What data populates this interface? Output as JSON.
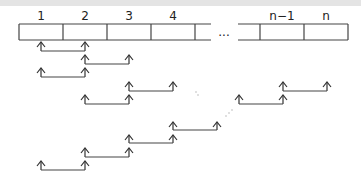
{
  "diagram": {
    "type": "array-pairwise-comparison",
    "cells": [
      {
        "label": "1",
        "x": 19,
        "w": 44
      },
      {
        "label": "2",
        "x": 63,
        "w": 44
      },
      {
        "label": "3",
        "x": 107,
        "w": 44
      },
      {
        "label": "4",
        "x": 151,
        "w": 44
      },
      {
        "label": "",
        "x": 195,
        "w": 16,
        "open_right": true
      },
      {
        "label": "n−1",
        "x": 260,
        "w": 44
      },
      {
        "label": "n",
        "x": 304,
        "w": 44
      }
    ],
    "ellipsis": "...",
    "colors": {
      "line": "#444444",
      "arrow": "#333333",
      "band": "#e4e4e4",
      "dots": "#aaaaaa"
    },
    "pairs": [
      {
        "from": 41,
        "to": 85,
        "tip": 42,
        "line": 51
      },
      {
        "from": 85,
        "to": 129,
        "tip": 55,
        "line": 64
      },
      {
        "from": 41,
        "to": 85,
        "tip": 68,
        "line": 77
      },
      {
        "from": 129,
        "to": 173,
        "tip": 82,
        "line": 91
      },
      {
        "from": 85,
        "to": 129,
        "tip": 95,
        "line": 104
      },
      {
        "from": 283,
        "to": 327,
        "tip": 82,
        "line": 91
      },
      {
        "from": 239,
        "to": 283,
        "tip": 95,
        "line": 104
      },
      {
        "from": 173,
        "to": 217,
        "tip": 122,
        "line": 130
      },
      {
        "from": 129,
        "to": 173,
        "tip": 135,
        "line": 143
      },
      {
        "from": 85,
        "to": 129,
        "tip": 148,
        "line": 157
      },
      {
        "from": 41,
        "to": 85,
        "tip": 161,
        "line": 170
      }
    ],
    "dot_marks": [
      {
        "x": 196,
        "y": 92
      },
      {
        "x": 198,
        "y": 95
      },
      {
        "x": 226,
        "y": 116
      },
      {
        "x": 229,
        "y": 113
      },
      {
        "x": 232,
        "y": 110
      }
    ]
  }
}
